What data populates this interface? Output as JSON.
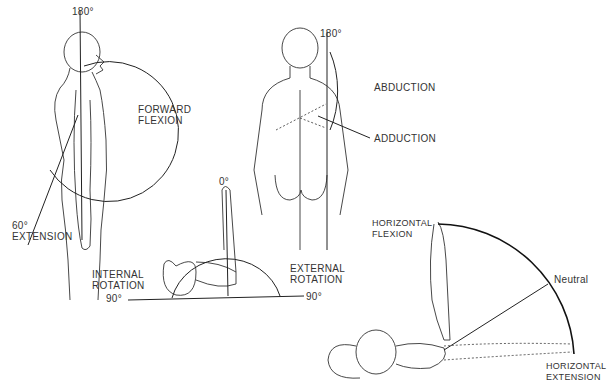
{
  "figures": {
    "side_view": {
      "top_angle": "180°",
      "flexion_label": "FORWARD\nFLEXION",
      "extension_angle": "60°",
      "extension_label": "EXTENSION"
    },
    "back_view": {
      "top_angle": "180°",
      "abduction_label": "ABDUCTION",
      "adduction_label": "ADDUCTION"
    },
    "rotation_view": {
      "top_angle": "0°",
      "internal_label": "INTERNAL\nROTATION",
      "internal_angle": "90°",
      "external_label": "EXTERNAL\nROTATION",
      "external_angle": "90°"
    },
    "horizontal_view": {
      "flexion_label": "HORIZONTAL\nFLEXION",
      "neutral_label": "Neutral",
      "extension_label": "HORIZONTAL\nEXTENSION"
    }
  },
  "colors": {
    "line": "#222222",
    "text": "#333333",
    "background": "#ffffff"
  }
}
